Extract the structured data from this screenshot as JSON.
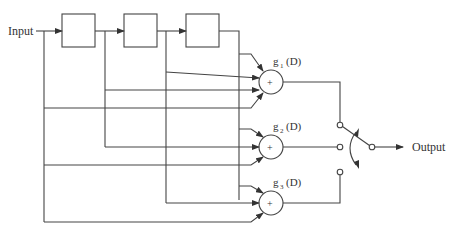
{
  "diagram": {
    "type": "convolutional-encoder",
    "input_label": "Input",
    "output_label": "Output",
    "delay_blocks": [
      {
        "id": "d1",
        "label": ""
      },
      {
        "id": "d2",
        "label": ""
      },
      {
        "id": "d3",
        "label": ""
      }
    ],
    "adders": [
      {
        "id": "adder1",
        "symbol": "+",
        "label_base": "g",
        "label_sub": "1",
        "label_tail": "(D)"
      },
      {
        "id": "adder2",
        "symbol": "+",
        "label_base": "g",
        "label_sub": "2",
        "label_tail": "(D)"
      },
      {
        "id": "adder3",
        "symbol": "+",
        "label_base": "g",
        "label_sub": "3",
        "label_tail": "(D)"
      }
    ],
    "switch": {
      "contacts": 3,
      "selected": "adder1"
    },
    "colors": {
      "line": "#444444",
      "text": "#333333",
      "background": "#ffffff"
    }
  }
}
